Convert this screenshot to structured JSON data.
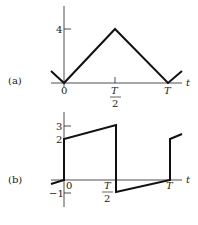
{
  "figure": {
    "panels": [
      {
        "id": "a",
        "label": "(a)",
        "type": "triangle-wave",
        "x_axis_label": "t",
        "y_ticks": [
          "4"
        ],
        "x_ticks": [
          "0",
          "T/2",
          "T"
        ],
        "x_tick_labels": {
          "zero": "0",
          "half_num": "T",
          "half_den": "2",
          "full": "T"
        },
        "points": [
          [
            -0.25,
            1
          ],
          [
            0,
            0
          ],
          [
            0.5,
            4
          ],
          [
            1,
            0
          ],
          [
            1.25,
            1
          ]
        ]
      },
      {
        "id": "b",
        "label": "(b)",
        "type": "sawtooth-square-wave",
        "x_axis_label": "t",
        "y_ticks": [
          "3",
          "2",
          "-1"
        ],
        "x_ticks": [
          "0",
          "T/2",
          "T"
        ],
        "x_tick_labels": {
          "zero": "0",
          "half_num": "T",
          "half_den": "2",
          "full": "T"
        },
        "y_tick_labels": {
          "three": "3",
          "two": "2",
          "minus_one": "−1"
        },
        "points": [
          [
            -0.25,
            -0.3
          ],
          [
            0,
            0
          ],
          [
            0,
            2
          ],
          [
            0.5,
            3
          ],
          [
            0.5,
            -1
          ],
          [
            1,
            0
          ],
          [
            1,
            2
          ],
          [
            1.25,
            2.4
          ]
        ]
      }
    ]
  }
}
